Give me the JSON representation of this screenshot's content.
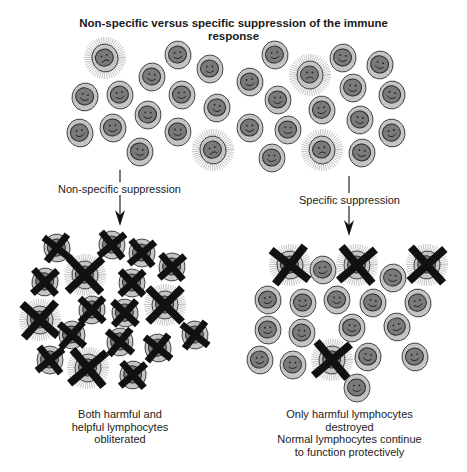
{
  "title": {
    "line1": "Non-specific versus specific  suppression of the immune",
    "line2": "response"
  },
  "labels": {
    "non_specific": "Non-specific suppression",
    "specific": "Specific suppression"
  },
  "captions": {
    "left": [
      "Both harmful and",
      "helpful lymphocytes",
      "obliterated"
    ],
    "right": [
      "Only harmful lymphocytes",
      "destroyed",
      "Normal lymphocytes continue",
      "to function protectively"
    ]
  },
  "colors": {
    "cell_outer": "#c4c4c4",
    "cell_inner": "#7a7a7a",
    "cell_stroke": "#3a3a3a",
    "cross": "#111111",
    "halo": "#9a9a9a"
  },
  "legend_icons": {
    "helpful_lymphocyte": "smiley-cell-icon",
    "harmful_lymphocyte": "sad-spiky-cell-icon",
    "destroyed": "cross-icon"
  },
  "groups": {
    "top": [
      {
        "x": 105,
        "y": 58,
        "type": "harmful"
      },
      {
        "x": 178,
        "y": 55,
        "type": "helpful"
      },
      {
        "x": 210,
        "y": 69,
        "type": "helpful"
      },
      {
        "x": 152,
        "y": 77,
        "type": "helpful"
      },
      {
        "x": 85,
        "y": 97,
        "type": "helpful"
      },
      {
        "x": 120,
        "y": 95,
        "type": "helpful"
      },
      {
        "x": 182,
        "y": 95,
        "type": "helpful"
      },
      {
        "x": 148,
        "y": 115,
        "type": "helpful"
      },
      {
        "x": 217,
        "y": 108,
        "type": "helpful"
      },
      {
        "x": 80,
        "y": 133,
        "type": "helpful"
      },
      {
        "x": 113,
        "y": 128,
        "type": "helpful"
      },
      {
        "x": 178,
        "y": 132,
        "type": "helpful"
      },
      {
        "x": 140,
        "y": 152,
        "type": "helpful"
      },
      {
        "x": 213,
        "y": 150,
        "type": "harmful"
      },
      {
        "x": 275,
        "y": 55,
        "type": "helpful"
      },
      {
        "x": 310,
        "y": 75,
        "type": "harmful"
      },
      {
        "x": 343,
        "y": 58,
        "type": "helpful"
      },
      {
        "x": 380,
        "y": 65,
        "type": "helpful"
      },
      {
        "x": 250,
        "y": 82,
        "type": "helpful"
      },
      {
        "x": 278,
        "y": 100,
        "type": "helpful"
      },
      {
        "x": 353,
        "y": 88,
        "type": "helpful"
      },
      {
        "x": 392,
        "y": 95,
        "type": "helpful"
      },
      {
        "x": 322,
        "y": 110,
        "type": "helpful"
      },
      {
        "x": 250,
        "y": 128,
        "type": "helpful"
      },
      {
        "x": 288,
        "y": 130,
        "type": "helpful"
      },
      {
        "x": 360,
        "y": 120,
        "type": "helpful"
      },
      {
        "x": 392,
        "y": 133,
        "type": "helpful"
      },
      {
        "x": 322,
        "y": 150,
        "type": "harmful"
      },
      {
        "x": 272,
        "y": 158,
        "type": "helpful"
      },
      {
        "x": 362,
        "y": 153,
        "type": "helpful"
      }
    ],
    "left": [
      {
        "x": 57,
        "y": 248,
        "type": "helpful",
        "crossed": true
      },
      {
        "x": 112,
        "y": 245,
        "type": "helpful",
        "crossed": true
      },
      {
        "x": 142,
        "y": 253,
        "type": "helpful",
        "crossed": true
      },
      {
        "x": 172,
        "y": 267,
        "type": "helpful",
        "crossed": true
      },
      {
        "x": 45,
        "y": 282,
        "type": "helpful",
        "crossed": true
      },
      {
        "x": 85,
        "y": 275,
        "type": "harmful",
        "crossed": true
      },
      {
        "x": 132,
        "y": 283,
        "type": "helpful",
        "crossed": true
      },
      {
        "x": 165,
        "y": 305,
        "type": "harmful",
        "crossed": true
      },
      {
        "x": 92,
        "y": 310,
        "type": "helpful",
        "crossed": true
      },
      {
        "x": 125,
        "y": 313,
        "type": "helpful",
        "crossed": true
      },
      {
        "x": 40,
        "y": 320,
        "type": "harmful",
        "crossed": true
      },
      {
        "x": 72,
        "y": 335,
        "type": "helpful",
        "crossed": true
      },
      {
        "x": 120,
        "y": 342,
        "type": "helpful",
        "crossed": true
      },
      {
        "x": 158,
        "y": 348,
        "type": "helpful",
        "crossed": true
      },
      {
        "x": 195,
        "y": 335,
        "type": "helpful",
        "crossed": true
      },
      {
        "x": 50,
        "y": 360,
        "type": "helpful",
        "crossed": true
      },
      {
        "x": 88,
        "y": 368,
        "type": "harmful",
        "crossed": true
      },
      {
        "x": 133,
        "y": 375,
        "type": "helpful",
        "crossed": true
      }
    ],
    "right": [
      {
        "x": 290,
        "y": 265,
        "type": "harmful",
        "crossed": true
      },
      {
        "x": 323,
        "y": 270,
        "type": "helpful",
        "crossed": false
      },
      {
        "x": 357,
        "y": 265,
        "type": "harmful",
        "crossed": true
      },
      {
        "x": 393,
        "y": 278,
        "type": "helpful",
        "crossed": false
      },
      {
        "x": 427,
        "y": 265,
        "type": "harmful",
        "crossed": true
      },
      {
        "x": 268,
        "y": 300,
        "type": "helpful",
        "crossed": false
      },
      {
        "x": 303,
        "y": 303,
        "type": "helpful",
        "crossed": false
      },
      {
        "x": 337,
        "y": 300,
        "type": "helpful",
        "crossed": false
      },
      {
        "x": 373,
        "y": 303,
        "type": "helpful",
        "crossed": false
      },
      {
        "x": 418,
        "y": 303,
        "type": "helpful",
        "crossed": false
      },
      {
        "x": 268,
        "y": 330,
        "type": "helpful",
        "crossed": false
      },
      {
        "x": 302,
        "y": 333,
        "type": "helpful",
        "crossed": false
      },
      {
        "x": 352,
        "y": 328,
        "type": "helpful",
        "crossed": false
      },
      {
        "x": 397,
        "y": 327,
        "type": "helpful",
        "crossed": false
      },
      {
        "x": 260,
        "y": 360,
        "type": "helpful",
        "crossed": false
      },
      {
        "x": 293,
        "y": 365,
        "type": "helpful",
        "crossed": false
      },
      {
        "x": 332,
        "y": 360,
        "type": "harmful",
        "crossed": true
      },
      {
        "x": 368,
        "y": 357,
        "type": "helpful",
        "crossed": false
      },
      {
        "x": 415,
        "y": 357,
        "type": "helpful",
        "crossed": false
      },
      {
        "x": 357,
        "y": 388,
        "type": "helpful",
        "crossed": false
      }
    ]
  }
}
